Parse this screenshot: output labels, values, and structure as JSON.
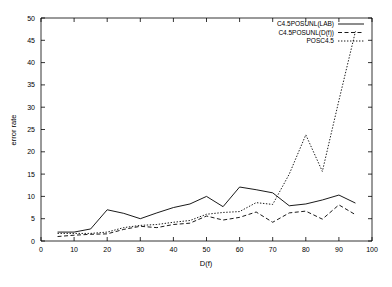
{
  "chart_data": {
    "type": "line",
    "title": "",
    "xlabel": "D(f)",
    "ylabel": "error rate",
    "xlim": [
      0,
      100
    ],
    "ylim": [
      0,
      50
    ],
    "xticks": [
      0,
      10,
      20,
      30,
      40,
      50,
      60,
      70,
      80,
      90,
      100
    ],
    "yticks": [
      0,
      5,
      10,
      15,
      20,
      25,
      30,
      35,
      40,
      45,
      50
    ],
    "grid": false,
    "legend_position": "top-right",
    "x": [
      5,
      10,
      15,
      20,
      25,
      30,
      35,
      40,
      45,
      50,
      55,
      60,
      65,
      70,
      75,
      80,
      85,
      90,
      95
    ],
    "series": [
      {
        "name": "C4.5POSUNL(LAB)",
        "style": "solid",
        "values": [
          2.0,
          2.0,
          2.7,
          7.0,
          6.2,
          5.0,
          6.3,
          7.5,
          8.3,
          10.0,
          7.7,
          12.1,
          11.5,
          10.8,
          7.9,
          8.3,
          9.2,
          10.3,
          8.5
        ]
      },
      {
        "name": "C4.5POSUNL(D(f))",
        "style": "dashed",
        "values": [
          1.0,
          1.3,
          1.5,
          1.6,
          2.6,
          3.3,
          3.0,
          3.7,
          4.0,
          5.6,
          4.7,
          5.3,
          6.5,
          4.2,
          6.3,
          6.7,
          4.9,
          8.1,
          5.9
        ]
      },
      {
        "name": "POSC4.5",
        "style": "dotted",
        "values": [
          1.7,
          1.7,
          1.7,
          2.0,
          3.0,
          3.5,
          3.7,
          4.2,
          4.6,
          6.0,
          6.4,
          6.6,
          8.6,
          8.2,
          15.0,
          23.8,
          15.6,
          31.5,
          47.0
        ]
      }
    ],
    "legend": [
      {
        "label": "C4.5POSUNL(LAB)",
        "style": "solid"
      },
      {
        "label": "C4.5POSUNL(D(f))",
        "style": "dashed"
      },
      {
        "label": "POSC4.5",
        "style": "dotted"
      }
    ]
  },
  "colors": {
    "axis": "#000000",
    "background": "#ffffff",
    "series": "#000000"
  }
}
